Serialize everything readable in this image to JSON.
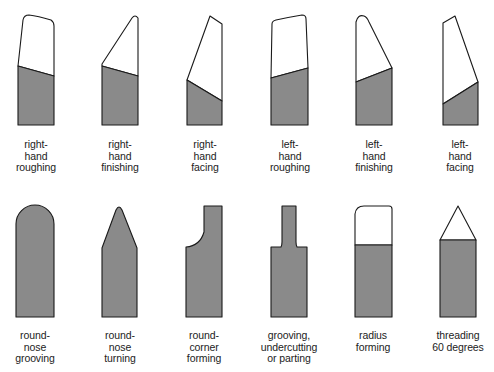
{
  "colors": {
    "shank_fill": "#8a8a8a",
    "outline": "#1a1a1a",
    "tip_fill": "#ffffff",
    "background": "#ffffff"
  },
  "tools": [
    {
      "id": "right-hand-roughing",
      "lines": [
        "right-",
        "hand",
        "roughing"
      ],
      "row": 1
    },
    {
      "id": "right-hand-finishing",
      "lines": [
        "right-",
        "hand",
        "finishing"
      ],
      "row": 1
    },
    {
      "id": "right-hand-facing",
      "lines": [
        "right-",
        "hand",
        "facing"
      ],
      "row": 1
    },
    {
      "id": "left-hand-roughing",
      "lines": [
        "left-",
        "hand",
        "roughing"
      ],
      "row": 1
    },
    {
      "id": "left-hand-finishing",
      "lines": [
        "left-",
        "hand",
        "finishing"
      ],
      "row": 1
    },
    {
      "id": "left-hand-facing",
      "lines": [
        "left-",
        "hand",
        "facing"
      ],
      "row": 1
    },
    {
      "id": "round-nose-grooving",
      "lines": [
        "round-",
        "nose",
        "grooving"
      ],
      "row": 2
    },
    {
      "id": "round-nose-turning",
      "lines": [
        "round-",
        "nose",
        "turning"
      ],
      "row": 2
    },
    {
      "id": "round-corner-forming",
      "lines": [
        "round-",
        "corner",
        "forming"
      ],
      "row": 2
    },
    {
      "id": "grooving-undercutting-parting",
      "lines": [
        "grooving,",
        "undercutting",
        "or parting"
      ],
      "row": 2
    },
    {
      "id": "radius-forming",
      "lines": [
        "radius",
        "forming"
      ],
      "row": 2
    },
    {
      "id": "threading-60-degrees",
      "lines": [
        "threading",
        "60 degrees"
      ],
      "row": 2
    }
  ]
}
